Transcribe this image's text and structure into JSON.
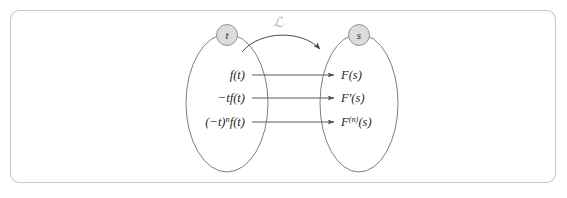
{
  "figure": {
    "background_color": "#ffffff",
    "frame_color": "#c9c9c9",
    "ellipse_stroke": "#6f6f6f",
    "node_fill": "#dcdcdc",
    "arrow_color": "#4a4a4a",
    "operator_color": "#b4b4b4"
  },
  "domain_node": {
    "label": "t",
    "name": "time-domain-node"
  },
  "range_node": {
    "label": "s",
    "name": "frequency-domain-node"
  },
  "operator": {
    "label": "ℒ",
    "name": "laplace-transform-operator",
    "description": "script L, Laplace transform operator"
  },
  "mappings": [
    {
      "source": "f(t)",
      "source_parts": {
        "base": "f(t)",
        "prefix": "",
        "sup": ""
      },
      "target": "F(s)",
      "target_parts": {
        "base": "F",
        "sup": "",
        "arg": "(s)"
      }
    },
    {
      "source": "−tf(t)",
      "source_parts": {
        "base": "tf(t)",
        "prefix": "−",
        "sup": ""
      },
      "target": "F′(s)",
      "target_parts": {
        "base": "F",
        "sup": "′",
        "arg": "(s)"
      }
    },
    {
      "source": "(−t)⁺f(t)",
      "source_parts": {
        "base": "(−t)",
        "prefix": "",
        "sup": "n",
        "suffix": "f(t)"
      },
      "target": "F⁽ⁿ⁾(s)",
      "target_parts": {
        "base": "F",
        "sup": "(n)",
        "arg": "(s)"
      }
    }
  ]
}
